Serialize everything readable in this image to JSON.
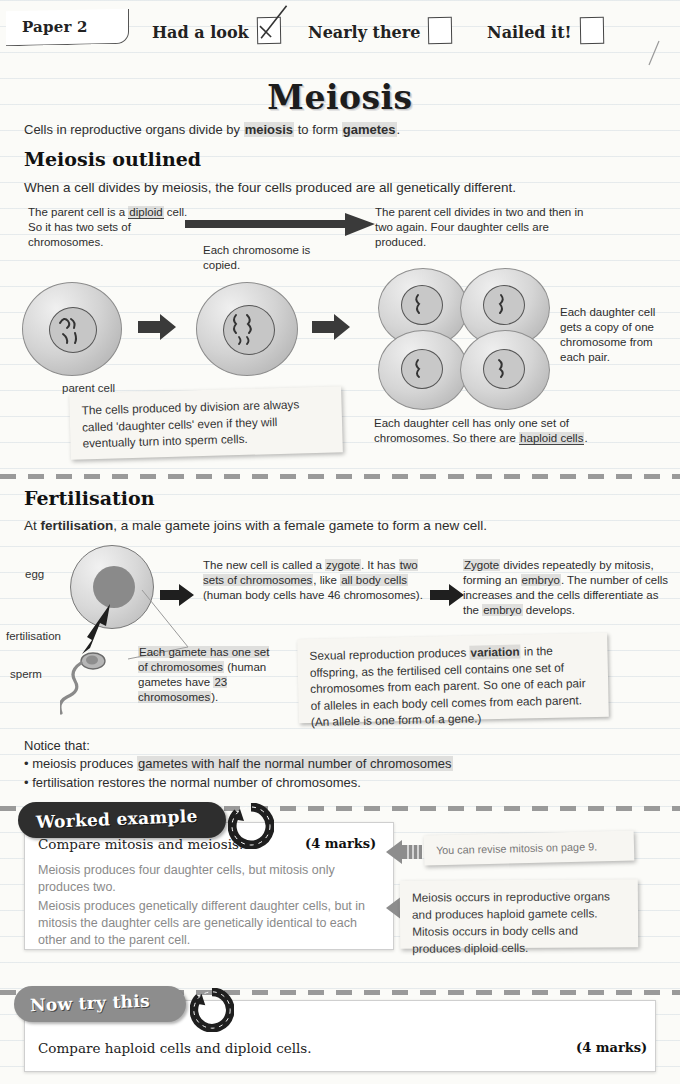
{
  "header": {
    "paper_label": "Paper 2",
    "checkboxes": [
      {
        "label": "Had a look",
        "checked": true
      },
      {
        "label": "Nearly there",
        "checked": false
      },
      {
        "label": "Nailed it!",
        "checked": false
      }
    ]
  },
  "title": "Meiosis",
  "intro": {
    "pre": "Cells in reproductive organs divide by ",
    "bold1": "meiosis",
    "mid": " to form ",
    "bold2": "gametes",
    "post": "."
  },
  "section1": {
    "heading": "Meiosis outlined",
    "lead": "When a cell divides by meiosis, the four cells produced are all genetically different.",
    "note_left": "The parent cell is a diploid cell. So it has two sets of chromosomes.",
    "note_mid": "Each chromosome is copied.",
    "note_right": "The parent cell divides in two and then in two again. Four daughter cells are produced.",
    "caption_parent": "parent cell",
    "note_daughter": "Each daughter cell gets a copy of one chromosome from each pair.",
    "note_haploid": "Each daughter cell has only one set of chromosomes. So there are haploid cells.",
    "sticky": "The cells produced by division are always called 'daughter cells' even if they will eventually turn into sperm cells."
  },
  "section2": {
    "heading": "Fertilisation",
    "lead_pre": "At ",
    "lead_bold": "fertilisation",
    "lead_post": ", a male gamete joins with a female gamete to form a new cell.",
    "label_egg": "egg",
    "label_fertilisation": "fertilisation",
    "label_sperm": "sperm",
    "note_zygote": "The new cell is called a zygote. It has two sets of chromosomes, like all body cells (human body cells have 46 chromosomes).",
    "note_embryo": "Zygote divides repeatedly by mitosis, forming an embryo. The number of cells increases and the cells differentiate as the embryo develops.",
    "note_gamete": "Each gamete has one set of chromosomes (human gametes have 23 chromosomes).",
    "sticky": "Sexual reproduction produces variation in the offspring, as the fertilised cell contains one set of chromosomes from each parent. So one of each pair of alleles in each body cell comes from each parent. (An allele is one form of a gene.)",
    "sticky_bold": "variation",
    "notice_title": "Notice that:",
    "notice_items": [
      "meiosis produces gametes with half the normal number of chromosomes",
      "fertilisation restores the normal number of chromosomes."
    ]
  },
  "worked_example": {
    "badge": "Worked example",
    "question": "Compare mitosis and meiosis.",
    "marks": "(4 marks)",
    "answer_1": "Meiosis produces four daughter cells, but mitosis only produces two.",
    "answer_2": "Meiosis produces genetically different daughter cells, but in mitosis the daughter cells are genetically identical to each other and to the parent cell.",
    "hint_1": "You can revise mitosis on page 9.",
    "hint_2": "Meiosis occurs in reproductive organs and produces haploid gamete cells. Mitosis occurs in body cells and produces diploid cells."
  },
  "now_try_this": {
    "badge": "Now try this",
    "question": "Compare haploid cells and diploid cells.",
    "marks": "(4 marks)"
  }
}
